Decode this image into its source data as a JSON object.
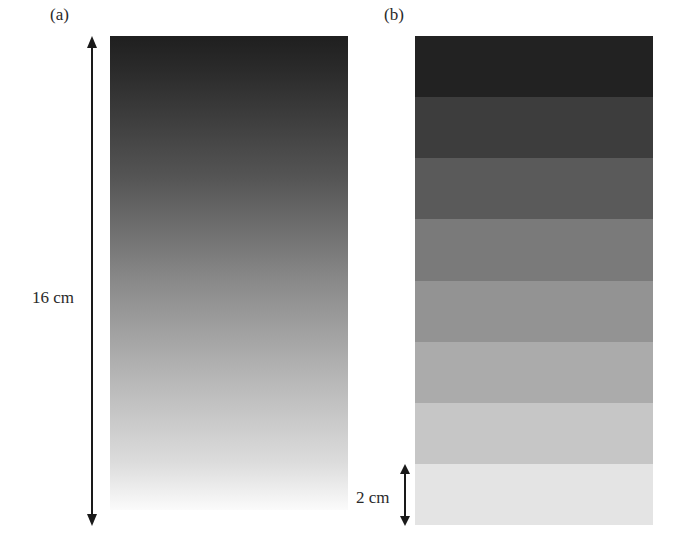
{
  "figure": {
    "panels": [
      {
        "label": "(a)",
        "description": "continuous grayscale gradient, dark at top to white at bottom",
        "gradient": {
          "top_color": "#1f1f1f",
          "bottom_color": "#fbfbfb"
        }
      },
      {
        "label": "(b)",
        "description": "stepped grayscale of 8 uniform bands",
        "bands": [
          {
            "index": 1,
            "color": "#222222"
          },
          {
            "index": 2,
            "color": "#3d3d3d"
          },
          {
            "index": 3,
            "color": "#5a5a5a"
          },
          {
            "index": 4,
            "color": "#7a7a7a"
          },
          {
            "index": 5,
            "color": "#939393"
          },
          {
            "index": 6,
            "color": "#ababab"
          },
          {
            "index": 7,
            "color": "#c6c6c6"
          },
          {
            "index": 8,
            "color": "#e4e4e4"
          }
        ]
      }
    ],
    "dimensions": {
      "total_height_label": "16 cm",
      "band_height_label": "2 cm"
    }
  }
}
